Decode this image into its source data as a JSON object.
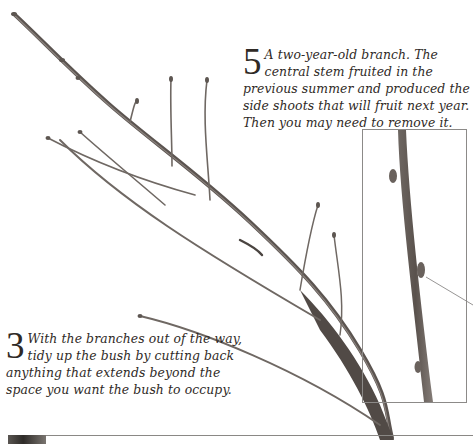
{
  "page": {
    "type": "gardening-book-spread",
    "photo_subject": "pruned branch with buds"
  },
  "captions": [
    {
      "id": "caption-5",
      "step_number": "5",
      "text": "A two-year-old branch. The central stem fruited in the previous summer and produced the side shoots that will fruit next year. Then you may need to remove it."
    },
    {
      "id": "caption-3",
      "step_number": "3",
      "text": "With the branches out of the way, tidy up the bush by cutting back anything that extends beyond the space you want the bush to occupy."
    }
  ],
  "inset": {
    "subject": "close-up of stem with bud",
    "has_leader_line": true
  },
  "colors": {
    "background": "#ffffff",
    "text": "#2f2a26",
    "branch_dark": "#4a4440",
    "branch_light": "#8e8782",
    "frame": "#8c8a88"
  }
}
